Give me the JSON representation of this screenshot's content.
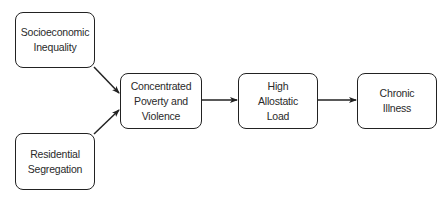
{
  "diagram": {
    "nodes": [
      {
        "id": "socioeconomic-inequality",
        "label": "Socioeconomic\nInequality"
      },
      {
        "id": "residential-segregation",
        "label": "Residential\nSegregation"
      },
      {
        "id": "concentrated-poverty-violence",
        "label": "Concentrated\nPoverty and\nViolence"
      },
      {
        "id": "high-allostatic-load",
        "label": "High\nAllostatic\nLoad"
      },
      {
        "id": "chronic-illness",
        "label": "Chronic\nIllness"
      }
    ],
    "edges": [
      {
        "from": "socioeconomic-inequality",
        "to": "concentrated-poverty-violence"
      },
      {
        "from": "residential-segregation",
        "to": "concentrated-poverty-violence"
      },
      {
        "from": "concentrated-poverty-violence",
        "to": "high-allostatic-load"
      },
      {
        "from": "high-allostatic-load",
        "to": "chronic-illness"
      }
    ],
    "colors": {
      "stroke": "#222222",
      "text": "#2a2a2a",
      "background": "#ffffff"
    }
  }
}
